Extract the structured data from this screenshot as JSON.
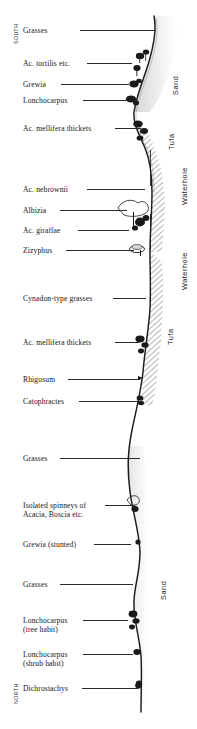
{
  "figure": {
    "width": 197,
    "height": 729,
    "type": "vegetation-transect-profile",
    "background": "#ffffff",
    "line_color": "#2a2a2a"
  },
  "orientation": {
    "top_label": "SOUTH",
    "bottom_label": "NORTH"
  },
  "species_labels": [
    {
      "id": "grasses-top",
      "text": "Grasses",
      "line2": "",
      "y": 27,
      "leader_x": 80,
      "leader_w": 76,
      "leader_y": 30
    },
    {
      "id": "ac-tortilis",
      "text": "Ac. tortilis etc.",
      "line2": "",
      "y": 60,
      "leader_x": 87,
      "leader_w": 45,
      "leader_y": 63
    },
    {
      "id": "grewia",
      "text": "Grewia",
      "line2": "",
      "y": 81,
      "leader_x": 61,
      "leader_w": 68,
      "leader_y": 84
    },
    {
      "id": "lonchocarpus-top",
      "text": "Lonchocarpus",
      "line2": "",
      "y": 97,
      "leader_x": 83,
      "leader_w": 45,
      "leader_y": 100
    },
    {
      "id": "ac-mellifera-thickets-1",
      "text": "Ac. mellifera thickets",
      "line2": "",
      "y": 125,
      "leader_x": 115,
      "leader_w": 26,
      "leader_y": 128
    },
    {
      "id": "ac-nebrownii",
      "text": "Ac. nebrownii",
      "line2": "",
      "y": 186,
      "leader_x": 87,
      "leader_w": 58,
      "leader_y": 189
    },
    {
      "id": "albizia",
      "text": "Albizia",
      "line2": "",
      "y": 207,
      "leader_x": 60,
      "leader_w": 67,
      "leader_y": 210
    },
    {
      "id": "ac-giraffae",
      "text": "Ac. giraffae",
      "line2": "",
      "y": 227,
      "leader_x": 78,
      "leader_w": 51,
      "leader_y": 230
    },
    {
      "id": "zizyphus",
      "text": "Zizyphus",
      "line2": "",
      "y": 247,
      "leader_x": 66,
      "leader_w": 68,
      "leader_y": 250
    },
    {
      "id": "cynadon-type-grasses",
      "text": "Cynadon-type grasses",
      "line2": "",
      "y": 295,
      "leader_x": 113,
      "leader_w": 33,
      "leader_y": 298
    },
    {
      "id": "ac-mellifera-thickets-2",
      "text": "Ac. mellifera thickets",
      "line2": "",
      "y": 339,
      "leader_x": 115,
      "leader_w": 24,
      "leader_y": 342
    },
    {
      "id": "rhigosum",
      "text": "Rhigosum",
      "line2": "",
      "y": 376,
      "leader_x": 68,
      "leader_w": 72,
      "leader_y": 379
    },
    {
      "id": "catophractes",
      "text": "Catophractes",
      "line2": "",
      "y": 398,
      "leader_x": 79,
      "leader_w": 62,
      "leader_y": 401
    },
    {
      "id": "grasses-mid",
      "text": "Grasses",
      "line2": "",
      "y": 455,
      "leader_x": 60,
      "leader_w": 80,
      "leader_y": 458
    },
    {
      "id": "isolated-spinneys",
      "text": "Isolated spinneys of",
      "line2": "Acacia, Boscia etc.",
      "y": 502,
      "leader_x": 105,
      "leader_w": 30,
      "leader_y": 505
    },
    {
      "id": "grewia-stunted",
      "text": "Grewia (stunted)",
      "line2": "",
      "y": 541,
      "leader_x": 94,
      "leader_w": 37,
      "leader_y": 544
    },
    {
      "id": "grasses-low",
      "text": "Grasses",
      "line2": "",
      "y": 581,
      "leader_x": 60,
      "leader_w": 73,
      "leader_y": 584
    },
    {
      "id": "lonchocarpus-tree",
      "text": "Lonchocarpus",
      "line2": "(tree habit)",
      "y": 617,
      "leader_x": 83,
      "leader_w": 45,
      "leader_y": 620
    },
    {
      "id": "lonchocarpus-shrub",
      "text": "Lonchocarpus",
      "line2": "(shrub habit)",
      "y": 651,
      "leader_x": 83,
      "leader_w": 50,
      "leader_y": 654
    },
    {
      "id": "dichrostachys",
      "text": "Dichrostachys",
      "line2": "",
      "y": 685,
      "leader_x": 82,
      "leader_w": 56,
      "leader_y": 688
    }
  ],
  "substrate_labels": [
    {
      "id": "sand-top",
      "text": "Sand",
      "x": 172,
      "y": 95,
      "rotate": -90
    },
    {
      "id": "tufa-top",
      "text": "Tufa",
      "x": 168,
      "y": 150,
      "rotate": -90
    },
    {
      "id": "waterhole-top",
      "text": "Waterhole",
      "x": 181,
      "y": 205,
      "rotate": -90
    },
    {
      "id": "waterhole-mid",
      "text": "Waterhole",
      "x": 181,
      "y": 290,
      "rotate": -90
    },
    {
      "id": "tufa-mid",
      "text": "Tufa",
      "x": 167,
      "y": 345,
      "rotate": -90
    },
    {
      "id": "sand-bottom",
      "text": "Sand",
      "x": 160,
      "y": 600,
      "rotate": -90
    }
  ],
  "profile": {
    "description": "Ground-surface profile line running top to bottom, undulating east-west",
    "points": "154,16 156,30 154,46 150,58 145,72 140,86 136,100 134,112 136,124 140,136 145,148 149,160 151,172 152,186 152,200 151,214 150,228 150,242 150,252 150,266 150,280 151,294 150,308 148,322 146,336 145,350 144,364 143,378 142,392 140,404 136,418 132,432 129,446 127,460 127,474 129,488 132,500 134,512 137,524 139,536 140,548 139,560 137,572 135,584 134,596 135,608 137,620 139,632 140,644 141,656 141,668 141,680 141,692 141,704"
  },
  "hatch_bands": [
    {
      "id": "tufa-band-upper",
      "top": 130,
      "bottom": 262
    },
    {
      "id": "tufa-band-lower",
      "top": 262,
      "bottom": 410
    }
  ]
}
